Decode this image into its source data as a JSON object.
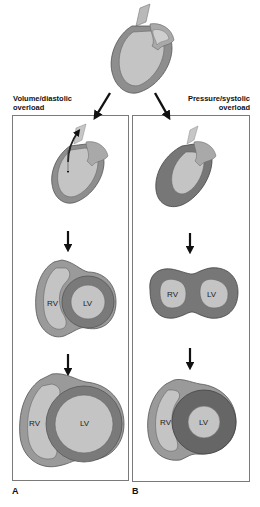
{
  "figure": {
    "top_heart": {
      "name": "normal-heart"
    },
    "panel_a": {
      "title_line1": "Volume/diastolic",
      "title_line2": "overload",
      "letter": "A",
      "stage2": {
        "rv": "RV",
        "lv": "LV"
      },
      "stage3": {
        "rv": "RV",
        "lv": "LV"
      }
    },
    "panel_b": {
      "title_line1": "Pressure/systolic",
      "title_line2": "overload",
      "letter": "B",
      "stage2": {
        "rv": "RV",
        "lv": "LV"
      },
      "stage3": {
        "rv": "RV",
        "lv": "LV"
      }
    }
  },
  "colors": {
    "wall_light": "#9a9a9a",
    "wall_dark": "#6f6f6f",
    "cavity": "#c4c4c4",
    "outline": "#555555",
    "border": "#7a7a7a",
    "arrow": "#111111"
  }
}
